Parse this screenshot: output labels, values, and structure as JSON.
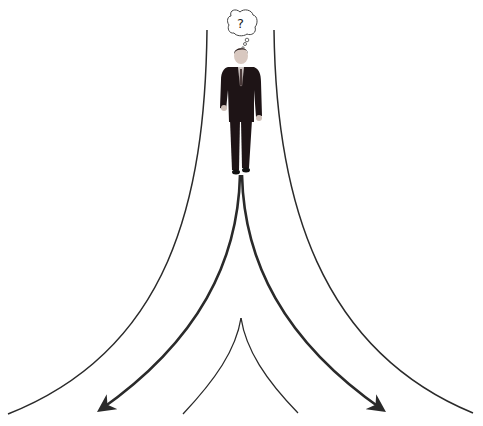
{
  "diagram": {
    "thought_bubble": {
      "text": "?"
    },
    "figure": "businessman-walking",
    "paths": [
      "left-path",
      "right-path"
    ],
    "colors": {
      "line": "#2a2a2a",
      "suit": "#1e1416",
      "background": "#ffffff"
    }
  }
}
